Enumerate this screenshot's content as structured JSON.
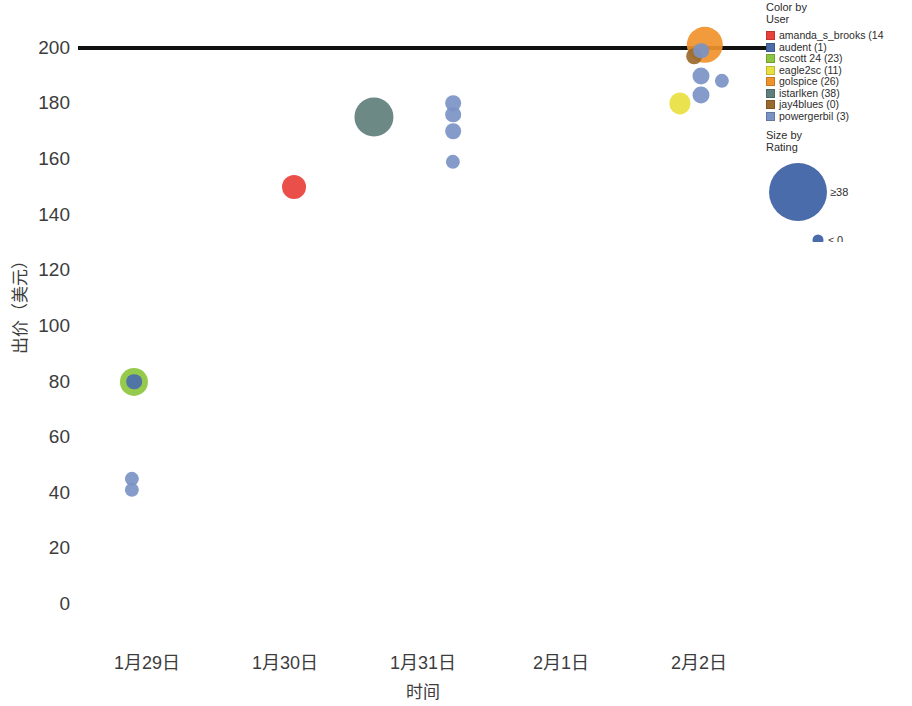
{
  "chart_data": {
    "type": "scatter",
    "title": "",
    "xlabel": "时间",
    "ylabel": "出价（美元）",
    "ylim": [
      0,
      210
    ],
    "yticks": [
      0,
      20,
      40,
      60,
      80,
      100,
      120,
      140,
      160,
      180,
      200
    ],
    "xticks": [
      "1月29日",
      "1月30日",
      "1月31日",
      "2月1日",
      "2月2日"
    ],
    "grid": false,
    "legend_position": "right",
    "annotations": [
      {
        "name": "reference-line",
        "type": "hline",
        "y": 200,
        "color": "#111111"
      }
    ],
    "series": [
      {
        "name": "amanda_s_brooks",
        "color": "#e8403a",
        "points": [
          {
            "x_label": "1月30日",
            "x_frac": 0.313,
            "y": 150,
            "size": 13
          }
        ]
      },
      {
        "name": "audent",
        "color": "#4a6cab",
        "points": [
          {
            "x_label": "1月29日",
            "x_frac": 0.0812,
            "y": 80,
            "size": 7
          }
        ]
      },
      {
        "name": "cscott 24",
        "color": "#8cc63e",
        "points": [
          {
            "x_label": "1月29日",
            "x_frac": 0.0812,
            "y": 80,
            "size": 16
          }
        ]
      },
      {
        "name": "eagle2sc",
        "color": "#e8e040",
        "points": [
          {
            "x_label": "2月2日",
            "x_frac": 0.8725,
            "y": 180,
            "size": 11
          }
        ]
      },
      {
        "name": "golspice",
        "color": "#f0932b",
        "points": [
          {
            "x_label": "2月2日",
            "x_frac": 0.9087,
            "y": 201,
            "size": 22
          }
        ]
      },
      {
        "name": "istarlken",
        "color": "#5f7f7c",
        "points": [
          {
            "x_label": "1月31日",
            "x_frac": 0.429,
            "y": 175,
            "size": 24
          }
        ]
      },
      {
        "name": "jay4blues",
        "color": "#9a6a2c",
        "points": [
          {
            "x_label": "2月2日",
            "x_frac": 0.8928,
            "y": 197,
            "size": 7
          }
        ]
      },
      {
        "name": "powergerbil",
        "color": "#7b92c4",
        "points": [
          {
            "x_label": "1月29日",
            "x_frac": 0.0783,
            "y": 45,
            "size": 6
          },
          {
            "x_label": "1月29日",
            "x_frac": 0.0783,
            "y": 41,
            "size": 6
          },
          {
            "x_label": "1月31日",
            "x_frac": 0.5435,
            "y": 180,
            "size": 7
          },
          {
            "x_label": "1月31日",
            "x_frac": 0.5435,
            "y": 176,
            "size": 7
          },
          {
            "x_label": "1月31日",
            "x_frac": 0.5435,
            "y": 170,
            "size": 7
          },
          {
            "x_label": "1月31日",
            "x_frac": 0.5435,
            "y": 159,
            "size": 6
          },
          {
            "x_label": "2月2日",
            "x_frac": 0.9029,
            "y": 199,
            "size": 7
          },
          {
            "x_label": "2月2日",
            "x_frac": 0.9029,
            "y": 190,
            "size": 8
          },
          {
            "x_label": "2月2日",
            "x_frac": 0.9029,
            "y": 183,
            "size": 8
          },
          {
            "x_label": "2月2日",
            "x_frac": 0.9333,
            "y": 188,
            "size": 6
          }
        ]
      }
    ]
  },
  "legend": {
    "color_title_line1": "Color by",
    "color_title_line2": "User",
    "items": [
      {
        "label": "amanda_s_brooks (14",
        "color": "#e8403a"
      },
      {
        "label": "audent (1)",
        "color": "#4a6cab"
      },
      {
        "label": "cscott 24 (23)",
        "color": "#8cc63e"
      },
      {
        "label": "eagle2sc (11)",
        "color": "#e8e040"
      },
      {
        "label": "golspice (26)",
        "color": "#f0932b"
      },
      {
        "label": "istarlken (38)",
        "color": "#5f7f7c"
      },
      {
        "label": "jay4blues (0)",
        "color": "#9a6a2c"
      },
      {
        "label": "powergerbil (3)",
        "color": "#7b92c4"
      }
    ],
    "size_title_line1": "Size by",
    "size_title_line2": "Rating",
    "size_max_label": "≥38",
    "size_min_label": "≤ 0",
    "size_bubble_color": "#4a6cab"
  }
}
